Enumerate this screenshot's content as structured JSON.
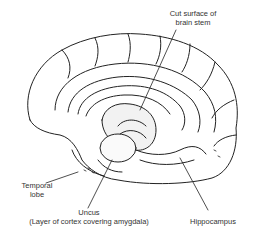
{
  "diagram": {
    "labels": {
      "cut_surface": [
        "Cut surface of",
        "brain stem"
      ],
      "temporal_lobe": [
        "Temporal",
        "lobe"
      ],
      "uncus": [
        "Uncus",
        "(Layer of cortex covering amygdala)"
      ],
      "hippocampus": "Hippocampus"
    },
    "colors": {
      "line": "#222222",
      "text": "#333333",
      "background": "#ffffff"
    }
  }
}
